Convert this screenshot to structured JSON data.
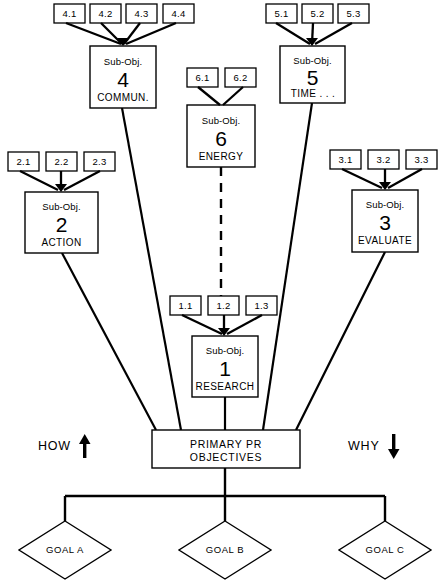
{
  "diagram": {
    "colors": {
      "stroke": "#000000",
      "background": "#ffffff",
      "text": "#000000"
    },
    "subobj_word": "Sub-Obj.",
    "nodes": {
      "primary": {
        "line1": "PRIMARY PR",
        "line2": "OBJECTIVES"
      },
      "sub1": {
        "head": "Sub-Obj.",
        "number": "1",
        "name": "RESEARCH",
        "tags": [
          "1.1",
          "1.2",
          "1.3"
        ]
      },
      "sub2": {
        "head": "Sub-Obj.",
        "number": "2",
        "name": "ACTION",
        "tags": [
          "2.1",
          "2.2",
          "2.3"
        ]
      },
      "sub3": {
        "head": "Sub-Obj.",
        "number": "3",
        "name": "EVALUATE",
        "tags": [
          "3.1",
          "3.2",
          "3.3"
        ]
      },
      "sub4": {
        "head": "Sub-Obj.",
        "number": "4",
        "name": "COMMUN.",
        "tags": [
          "4.1",
          "4.2",
          "4.3",
          "4.4"
        ]
      },
      "sub5": {
        "head": "Sub-Obj.",
        "number": "5",
        "name": "TIME . . .",
        "tags": [
          "5.1",
          "5.2",
          "5.3"
        ]
      },
      "sub6": {
        "head": "Sub-Obj.",
        "number": "6",
        "name": "ENERGY",
        "tags": [
          "6.1",
          "6.2"
        ]
      }
    },
    "goals": [
      {
        "label": "GOAL A"
      },
      {
        "label": "GOAL B"
      },
      {
        "label": "GOAL C"
      }
    ],
    "directions": {
      "left": {
        "label": "HOW",
        "arrow": "up"
      },
      "right": {
        "label": "WHY",
        "arrow": "down"
      }
    }
  }
}
